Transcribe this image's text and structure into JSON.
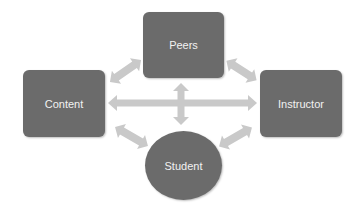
{
  "diagram": {
    "type": "interaction-model",
    "colors": {
      "node_fill": "#6b6b6b",
      "node_text": "#f2f2f2",
      "arrow_fill": "#c9c9c9",
      "background": "#ffffff"
    },
    "nodes": {
      "peers": {
        "label": "Peers",
        "shape": "rounded-rectangle"
      },
      "content": {
        "label": "Content",
        "shape": "rounded-rectangle"
      },
      "instructor": {
        "label": "Instructor",
        "shape": "rounded-rectangle"
      },
      "student": {
        "label": "Student",
        "shape": "ellipse"
      }
    },
    "edges": [
      {
        "from": "Content",
        "to": "Peers",
        "type": "bidirectional"
      },
      {
        "from": "Peers",
        "to": "Instructor",
        "type": "bidirectional"
      },
      {
        "from": "Content",
        "to": "Instructor",
        "type": "bidirectional"
      },
      {
        "from": "Peers",
        "to": "Student",
        "type": "bidirectional"
      },
      {
        "from": "Content",
        "to": "Student",
        "type": "bidirectional"
      },
      {
        "from": "Instructor",
        "to": "Student",
        "type": "bidirectional"
      }
    ]
  }
}
